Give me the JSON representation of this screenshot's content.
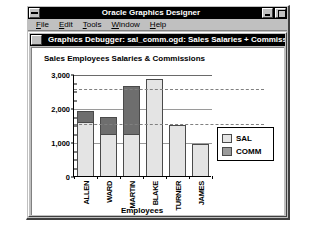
{
  "window": {
    "title": "Oracle Graphics Designer",
    "sys_menu_icon": "system-menu-icon",
    "minimize_icon": "minimize-icon",
    "maximize_icon": "maximize-icon"
  },
  "menu": {
    "items": [
      {
        "label": "File",
        "accel": "F"
      },
      {
        "label": "Edit",
        "accel": "E"
      },
      {
        "label": "Tools",
        "accel": "T"
      },
      {
        "label": "Window",
        "accel": "W"
      },
      {
        "label": "Help",
        "accel": "H"
      }
    ]
  },
  "debugger": {
    "title": "Graphics Debugger: sal_comm.ogd: Sales Salaries + Commissions",
    "sys_menu_icon": "system-menu-icon"
  },
  "colors": {
    "sal": "#e4e4e4",
    "comm": "#6e6e6e",
    "legend_comm_swatch": "#9a9a9a",
    "bar_outline": "#4a4a4a",
    "titlebar": "#000000",
    "face": "#c0c0c0"
  },
  "chart_data": {
    "type": "bar",
    "subtype": "stacked",
    "title": "Sales Employees Salaries & Commissions",
    "xlabel": "Employees",
    "ylabel": "",
    "categories": [
      "ALLEN",
      "WARD",
      "MARTIN",
      "BLAKE",
      "TURNER",
      "JAMES"
    ],
    "series": [
      {
        "name": "SAL",
        "values": [
          1600,
          1250,
          1250,
          2850,
          1500,
          950
        ]
      },
      {
        "name": "COMM",
        "values": [
          300,
          500,
          1400,
          0,
          0,
          0
        ]
      }
    ],
    "totals": [
      1900,
      1750,
      2650,
      2850,
      1500,
      950
    ],
    "ylim": [
      0,
      3000
    ],
    "yticks": [
      0,
      1000,
      2000,
      3000
    ],
    "ytick_labels": [
      "0",
      "1,000",
      "2,000",
      "3,000"
    ],
    "yminor_step": 250,
    "gridlines": [
      1000,
      2000,
      3000
    ],
    "reference_lines": [
      2600,
      1550
    ],
    "grid": true,
    "legend": {
      "position": "right",
      "entries": [
        "SAL",
        "COMM"
      ]
    }
  }
}
